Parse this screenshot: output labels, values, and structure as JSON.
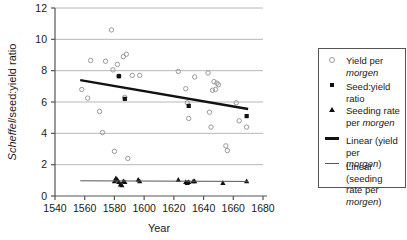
{
  "chart_data": {
    "type": "scatter",
    "title": "",
    "xlabel": "Year",
    "ylabel_html": "Scheffel/seed:yield ratio",
    "ylabel_italic_part": "Scheffel",
    "xlim": [
      1540,
      1680
    ],
    "ylim": [
      0,
      12
    ],
    "xticks": [
      1540,
      1560,
      1580,
      1600,
      1620,
      1640,
      1660,
      1680
    ],
    "yticks": [
      0,
      2,
      4,
      6,
      8,
      10,
      12
    ],
    "grid": "horizontal",
    "legend_position": "right",
    "series": [
      {
        "name": "Yield per morgen",
        "marker": "open-circle",
        "color": "#9a9a9a",
        "points": [
          [
            1558,
            6.8
          ],
          [
            1562,
            6.25
          ],
          [
            1564,
            8.65
          ],
          [
            1570,
            5.4
          ],
          [
            1572,
            4.05
          ],
          [
            1574,
            8.6
          ],
          [
            1578,
            10.6
          ],
          [
            1579,
            8.05
          ],
          [
            1580,
            2.85
          ],
          [
            1582,
            8.4
          ],
          [
            1583,
            7.65
          ],
          [
            1586,
            8.9
          ],
          [
            1587,
            6.3
          ],
          [
            1588,
            9.05
          ],
          [
            1589,
            2.4
          ],
          [
            1592,
            7.7
          ],
          [
            1597,
            7.7
          ],
          [
            1623,
            7.95
          ],
          [
            1628,
            6.85
          ],
          [
            1629,
            5.95
          ],
          [
            1630,
            4.95
          ],
          [
            1634,
            7.6
          ],
          [
            1643,
            7.85
          ],
          [
            1644,
            5.35
          ],
          [
            1645,
            4.4
          ],
          [
            1646,
            6.75
          ],
          [
            1647,
            7.3
          ],
          [
            1648,
            6.8
          ],
          [
            1649,
            7.2
          ],
          [
            1650,
            7.1
          ],
          [
            1655,
            3.2
          ],
          [
            1656,
            2.9
          ],
          [
            1662,
            5.95
          ],
          [
            1664,
            4.8
          ],
          [
            1669,
            4.4
          ]
        ]
      },
      {
        "name": "Seed:yield ratio",
        "marker": "filled-square",
        "color": "#111111",
        "points": [
          [
            1583,
            7.65
          ],
          [
            1587,
            6.2
          ],
          [
            1630,
            5.75
          ],
          [
            1669,
            5.1
          ]
        ]
      },
      {
        "name": "Seeding rate per morgen",
        "marker": "filled-triangle",
        "color": "#111111",
        "points": [
          [
            1580,
            0.95
          ],
          [
            1581,
            1.15
          ],
          [
            1582,
            1.05
          ],
          [
            1583,
            0.9
          ],
          [
            1584,
            0.75
          ],
          [
            1585,
            0.7
          ],
          [
            1586,
            0.95
          ],
          [
            1587,
            0.9
          ],
          [
            1596,
            1.05
          ],
          [
            1597,
            0.95
          ],
          [
            1623,
            1.05
          ],
          [
            1628,
            0.9
          ],
          [
            1629,
            0.85
          ],
          [
            1630,
            0.9
          ],
          [
            1633,
            0.95
          ],
          [
            1634,
            0.95
          ],
          [
            1653,
            0.85
          ],
          [
            1669,
            0.95
          ]
        ]
      }
    ],
    "trendlines": [
      {
        "name": "Linear (yield per morgen)",
        "style": "thick",
        "color": "#111111",
        "x0": 1557,
        "y0": 7.4,
        "x1": 1670,
        "y1": 5.55
      },
      {
        "name": "Linear (seeding rate per morgen)",
        "style": "thin",
        "color": "#555555",
        "x0": 1557,
        "y0": 0.97,
        "x1": 1670,
        "y1": 0.93
      }
    ]
  },
  "axes": {
    "x_title": "Year",
    "y_title_italic": "Scheffel",
    "y_title_rest": "/seed:yield ratio",
    "x_tick_labels": [
      "1540",
      "1560",
      "1580",
      "1600",
      "1620",
      "1640",
      "1660",
      "1680"
    ],
    "y_tick_labels": [
      "0",
      "2",
      "4",
      "6",
      "8",
      "10",
      "12"
    ]
  },
  "legend": {
    "items": [
      {
        "marker": "open-circle-icon",
        "label_pre": "Yield per ",
        "label_italic": "morgen",
        "label_post": ""
      },
      {
        "marker": "filled-square-icon",
        "label_pre": "Seed:yield ratio",
        "label_italic": "",
        "label_post": ""
      },
      {
        "marker": "filled-triangle-icon",
        "label_pre": "Seeding rate\nper ",
        "label_italic": "morgen",
        "label_post": ""
      },
      {
        "marker": "thick-line-icon",
        "label_pre": "Linear (yield per\n",
        "label_italic": "morgen",
        "label_post": ")"
      },
      {
        "marker": "thin-line-icon",
        "label_pre": "Linear (seeding\nrate per ",
        "label_italic": "morgen",
        "label_post": ")"
      }
    ]
  }
}
